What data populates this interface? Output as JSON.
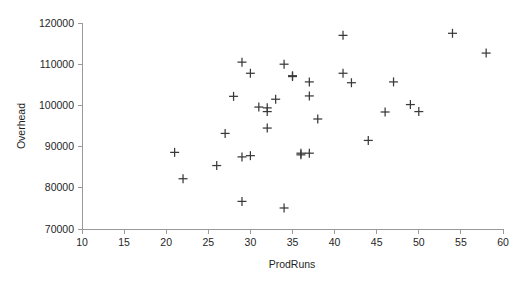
{
  "chart_data": {
    "type": "scatter",
    "title": "",
    "xlabel": "ProdRuns",
    "ylabel": "Overhead",
    "xlim": [
      10,
      60
    ],
    "ylim": [
      70000,
      120000
    ],
    "xticks": [
      10,
      15,
      20,
      25,
      30,
      35,
      40,
      45,
      50,
      55,
      60
    ],
    "xtick_labels": [
      "10",
      "15",
      "20",
      "25",
      "30",
      "35",
      "40",
      "45",
      "50",
      "55",
      "60"
    ],
    "yticks": [
      70000,
      80000,
      90000,
      100000,
      110000,
      120000
    ],
    "ytick_labels": [
      "70000",
      "80000",
      "90000",
      "100000",
      "110000",
      "120000"
    ],
    "grid": false,
    "legend": null,
    "marker": "plus",
    "marker_color": "#3a3a3a",
    "x": [
      21,
      22,
      26,
      27,
      28,
      29,
      29,
      29,
      30,
      30,
      31,
      32,
      32,
      32,
      33,
      34,
      34,
      35,
      35,
      36,
      36,
      37,
      37,
      37,
      38,
      41,
      41,
      41,
      42,
      44,
      46,
      47,
      49,
      50,
      50,
      54,
      58
    ],
    "y": [
      88600,
      82200,
      85400,
      93200,
      102200,
      110500,
      87500,
      76700,
      107800,
      87800,
      99600,
      99400,
      98500,
      94500,
      101500,
      110000,
      75100,
      107200,
      88000,
      88400,
      102300,
      105700,
      96700,
      88400,
      96700,
      117000,
      107800,
      105500,
      105500,
      91500,
      98400,
      105700,
      100200,
      98500,
      98500,
      117500,
      112700
    ],
    "points": [
      {
        "x": 21,
        "y": 88600
      },
      {
        "x": 22,
        "y": 82200
      },
      {
        "x": 26,
        "y": 85400
      },
      {
        "x": 27,
        "y": 93200
      },
      {
        "x": 28,
        "y": 102200
      },
      {
        "x": 29,
        "y": 110500
      },
      {
        "x": 29,
        "y": 87500
      },
      {
        "x": 29,
        "y": 76700
      },
      {
        "x": 30,
        "y": 107800
      },
      {
        "x": 30,
        "y": 87800
      },
      {
        "x": 31,
        "y": 99600
      },
      {
        "x": 32,
        "y": 99400
      },
      {
        "x": 32,
        "y": 98500
      },
      {
        "x": 32,
        "y": 94500
      },
      {
        "x": 33,
        "y": 101500
      },
      {
        "x": 34,
        "y": 110000
      },
      {
        "x": 34,
        "y": 75100
      },
      {
        "x": 35,
        "y": 107200
      },
      {
        "x": 35,
        "y": 107000
      },
      {
        "x": 36,
        "y": 88000
      },
      {
        "x": 36,
        "y": 88400
      },
      {
        "x": 37,
        "y": 105700
      },
      {
        "x": 37,
        "y": 102300
      },
      {
        "x": 37,
        "y": 88400
      },
      {
        "x": 38,
        "y": 96700
      },
      {
        "x": 41,
        "y": 117000
      },
      {
        "x": 41,
        "y": 107800
      },
      {
        "x": 42,
        "y": 105500
      },
      {
        "x": 44,
        "y": 91500
      },
      {
        "x": 46,
        "y": 98400
      },
      {
        "x": 47,
        "y": 105700
      },
      {
        "x": 49,
        "y": 100200
      },
      {
        "x": 50,
        "y": 98500
      },
      {
        "x": 54,
        "y": 117500
      },
      {
        "x": 58,
        "y": 112700
      }
    ]
  },
  "geometry": {
    "plot_left": 82,
    "plot_right": 503,
    "plot_top": 23,
    "plot_bottom": 229,
    "marker_half": 4.5
  },
  "colors": {
    "axis": "#9a9a9a",
    "text": "#1f1f1f",
    "marker": "#3a3a3a",
    "background": "#ffffff"
  }
}
